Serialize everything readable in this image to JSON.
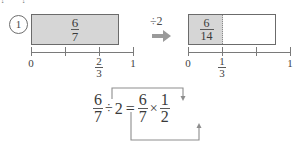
{
  "top_clipped_text": "? ?",
  "item": {
    "number": "1"
  },
  "left_model": {
    "bar": {
      "fraction_numerator": "6",
      "fraction_denominator": "7",
      "fill_ratio": 1.0
    },
    "number_line": {
      "ticks": [
        {
          "label_numerator": "0",
          "label_denominator": "",
          "position": 0.0
        },
        {
          "label_numerator": "",
          "label_denominator": "",
          "position": 0.3333
        },
        {
          "label_numerator": "2",
          "label_denominator": "3",
          "position": 0.6667
        },
        {
          "label_numerator": "1",
          "label_denominator": "",
          "position": 1.0
        }
      ]
    }
  },
  "operator": {
    "label": "÷2",
    "arrow_icon": "thick-right-arrow-icon"
  },
  "right_model": {
    "bar": {
      "fraction_numerator": "6",
      "fraction_denominator": "14",
      "fill_ratio": 0.4
    },
    "number_line": {
      "ticks": [
        {
          "label_numerator": "0",
          "label_denominator": "",
          "position": 0.0
        },
        {
          "label_numerator": "1",
          "label_denominator": "3",
          "position": 0.3333
        },
        {
          "label_numerator": "",
          "label_denominator": "",
          "position": 0.6667
        },
        {
          "label_numerator": "1",
          "label_denominator": "",
          "position": 1.0
        }
      ]
    }
  },
  "equation": {
    "lhs_numerator": "6",
    "lhs_denominator": "7",
    "divide_symbol": "÷",
    "divisor": "2",
    "equals": "=",
    "rhs1_numerator": "6",
    "rhs1_denominator": "7",
    "multiply_symbol": "×",
    "rhs2_numerator": "1",
    "rhs2_denominator": "2"
  },
  "colors": {
    "fill_gray": "#d6d6d6",
    "line_gray": "#6b6b6b",
    "text_gray": "#3a3a3a",
    "arrow_gray": "#9a9a9a"
  }
}
